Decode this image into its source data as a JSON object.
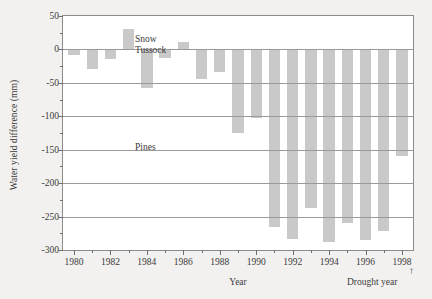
{
  "chart_data": {
    "type": "bar",
    "title": "",
    "xlabel": "Year",
    "ylabel": "Water yield difference (mm)",
    "ylim": [
      -300,
      50
    ],
    "xlim": [
      1979.4,
      1998.6
    ],
    "grid": true,
    "legend_position": "none",
    "y_ticks_major": [
      50,
      0,
      -50,
      -100,
      -150,
      -200,
      -250,
      -300
    ],
    "y_tick_labels": [
      "50",
      "0",
      "-50",
      "-100",
      "-150",
      "-200",
      "-250",
      "-300"
    ],
    "y_ticks_minor": [
      25,
      -25,
      -75,
      -125,
      -175,
      -225,
      -275
    ],
    "x_ticks_major": [
      1980,
      1982,
      1984,
      1986,
      1988,
      1990,
      1992,
      1994,
      1996,
      1998
    ],
    "x_tick_labels": [
      "1980",
      "1982",
      "1984",
      "1986",
      "1988",
      "1990",
      "1992",
      "1994",
      "1996",
      "1998"
    ],
    "x_ticks_minor": [
      1981,
      1983,
      1985,
      1987,
      1989,
      1991,
      1993,
      1995,
      1997
    ],
    "categories": [
      1980,
      1981,
      1982,
      1983,
      1984,
      1985,
      1986,
      1987,
      1988,
      1989,
      1990,
      1991,
      1992,
      1993,
      1994,
      1995,
      1996,
      1997,
      1998
    ],
    "values": [
      -8,
      -30,
      -14,
      30,
      -58,
      -13,
      11,
      -44,
      -34,
      -125,
      -103,
      -265,
      -283,
      -237,
      -288,
      -259,
      -285,
      -271,
      -160
    ],
    "bar_color": "#c9c9c9",
    "annotations": [
      {
        "id": "snow-tussock",
        "text": "Snow\nTussock",
        "line1": "Snow",
        "line2": "Tussock",
        "at_y": 38
      },
      {
        "id": "pines",
        "text": "Pines",
        "at_y": -135
      },
      {
        "id": "drought-year",
        "text": "Drought year",
        "points_to_x": 1998
      }
    ]
  },
  "axes": {
    "y_label": "Water yield difference (mm)",
    "x_label": "Year"
  },
  "annotations": {
    "snow_line1": "Snow",
    "snow_line2": "Tussock",
    "pines": "Pines",
    "drought": "Drought year",
    "drought_arrow": "↑"
  },
  "colors": {
    "background": "#f2f1ef",
    "plot_background": "#ffffff",
    "bar": "#c9c9c9",
    "axis": "#8c8c8c",
    "grid": "#9a9a9a",
    "text": "#3b3b3b"
  }
}
